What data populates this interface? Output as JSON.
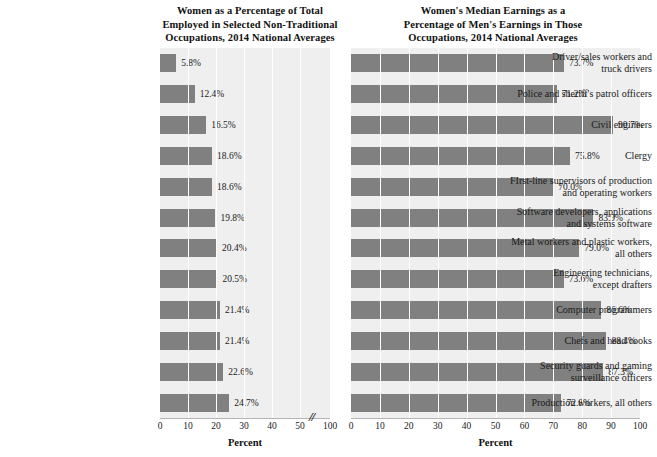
{
  "figure": {
    "copyright": "© 2018 Cengage",
    "bar_color": "#808080",
    "plot_background": "#efefef",
    "gridline_color": "#ffffff",
    "axis_break_glyph": "//"
  },
  "categories": [
    "Driver/sales workers and truck drivers",
    "Police and sheriff's patrol officers",
    "Civil engineers",
    "Clergy",
    "FIrst-line supervisors of production and operating workers",
    "Software developers, applications and systems software",
    "Metal workers and plastic workers, all others",
    "Engineering technicians, except drafters",
    "Computer programmers",
    "Chefs and head cooks",
    "Security guards and gaming surveillance officers",
    "Production workers, all others"
  ],
  "category_lines": [
    [
      "Driver/sales workers and",
      "truck drivers"
    ],
    [
      "Police and sheriff's patrol officers"
    ],
    [
      "Civil engineers"
    ],
    [
      "Clergy"
    ],
    [
      "FIrst-line supervisors of production",
      "and operating workers"
    ],
    [
      "Software developers, applications",
      "and systems software"
    ],
    [
      "Metal workers and plastic workers,",
      "all others"
    ],
    [
      "Engineering technicians,",
      "except drafters"
    ],
    [
      "Computer programmers"
    ],
    [
      "Chefs and head cooks"
    ],
    [
      "Security guards and gaming",
      "surveillance officers"
    ],
    [
      "Production workers, all others"
    ]
  ],
  "chart_data": [
    {
      "type": "bar",
      "orientation": "horizontal",
      "title": "Women as a Percentage of Total Employed in Selected Non-Traditional Occupations, 2014 National Averages",
      "title_lines": [
        "Women as a Percentage of Total",
        "Employed in Selected Non-Traditional",
        "Occupations, 2014 National Averages"
      ],
      "xlabel": "Percent",
      "ylabel": "",
      "xlim": [
        0,
        100
      ],
      "axis_break": true,
      "axis_break_between": [
        50,
        100
      ],
      "xticks": [
        0,
        10,
        20,
        30,
        40,
        50,
        100
      ],
      "xtick_labels": [
        "0",
        "10",
        "20",
        "30",
        "40",
        "50",
        "100"
      ],
      "grid": true,
      "legend": "none",
      "categories": [
        "Driver/sales workers and truck drivers",
        "Police and sheriff's patrol officers",
        "Civil engineers",
        "Clergy",
        "FIrst-line supervisors of production and operating workers",
        "Software developers, applications and systems software",
        "Metal workers and plastic workers, all others",
        "Engineering technicians, except drafters",
        "Computer programmers",
        "Chefs and head cooks",
        "Security guards and gaming surveillance officers",
        "Production workers, all others"
      ],
      "values": [
        5.8,
        12.4,
        16.5,
        18.6,
        18.6,
        19.8,
        20.4,
        20.5,
        21.4,
        21.4,
        22.6,
        24.7
      ],
      "value_labels": [
        "5.8%",
        "12.4%",
        "16.5%",
        "18.6%",
        "18.6%",
        "19.8%",
        "20.4%",
        "20.5%",
        "21.4%",
        "21.4%",
        "22.6%",
        "24.7%"
      ]
    },
    {
      "type": "bar",
      "orientation": "horizontal",
      "title": "Women's Median Earnings as a Percentage of Men's Earnings in Those Occupations, 2014 National Averages",
      "title_lines": [
        "Women's Median Earnings as a",
        "Percentage of Men's Earnings in Those",
        "Occupations, 2014 National Averages"
      ],
      "xlabel": "Percent",
      "ylabel": "",
      "xlim": [
        0,
        100
      ],
      "axis_break": false,
      "xticks": [
        0,
        10,
        20,
        30,
        40,
        50,
        60,
        70,
        80,
        90,
        100
      ],
      "xtick_labels": [
        "0",
        "10",
        "20",
        "30",
        "40",
        "50",
        "60",
        "70",
        "80",
        "90",
        "100"
      ],
      "grid": true,
      "legend": "none",
      "categories": [
        "Driver/sales workers and truck drivers",
        "Police and sheriff's patrol officers",
        "Civil engineers",
        "Clergy",
        "FIrst-line supervisors of production and operating workers",
        "Software developers, applications and systems software",
        "Metal workers and plastic workers, all others",
        "Engineering technicians, except drafters",
        "Computer programmers",
        "Chefs and head cooks",
        "Security guards and gaming surveillance officers",
        "Production workers, all others"
      ],
      "values": [
        73.7,
        71.2,
        90.7,
        75.8,
        70.0,
        83.9,
        79.0,
        73.6,
        86.6,
        88.4,
        87.3,
        72.8
      ],
      "value_labels": [
        "73.7%",
        "71.2%",
        "90.7%",
        "75.8%",
        "70.0%",
        "83.9%",
        "79.0%",
        "73.6%",
        "86.6%",
        "88.4%",
        "87.3%",
        "72.8%"
      ]
    }
  ]
}
